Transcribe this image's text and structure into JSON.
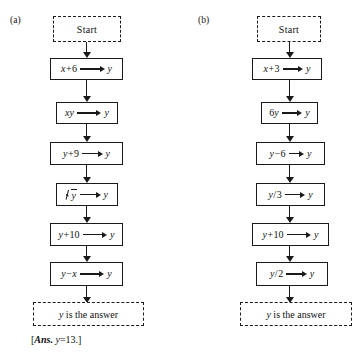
{
  "figure": {
    "panels": [
      {
        "label": "(a)",
        "start_label": "Start",
        "answer_label": "y is the answer",
        "answer_note": "[Ans. y = 13.]",
        "answer_note_parts": {
          "open": "[",
          "ans_word": "Ans.",
          "variable": "y",
          "equals": "=",
          "value": "13",
          "close": ".]"
        },
        "steps": [
          {
            "lhs": "x+6",
            "rhs": "y",
            "arrow": "long",
            "kind": "plain"
          },
          {
            "lhs": "xy",
            "rhs": "y",
            "arrow": "long",
            "kind": "plain"
          },
          {
            "lhs": "y+9",
            "rhs": "y",
            "arrow": "mid",
            "kind": "plain"
          },
          {
            "lhs": "√y",
            "rhs": "y",
            "arrow": "mid",
            "kind": "radical"
          },
          {
            "lhs": "y+10",
            "rhs": "y",
            "arrow": "long",
            "kind": "plain"
          },
          {
            "lhs": "y−x",
            "rhs": "y",
            "arrow": "long",
            "kind": "plain"
          }
        ]
      },
      {
        "label": "(b)",
        "start_label": "Start",
        "answer_label": "y is the answer",
        "steps": [
          {
            "lhs": "x+3",
            "rhs": "y",
            "arrow": "mid",
            "kind": "plain"
          },
          {
            "lhs": "6y",
            "rhs": "y",
            "arrow": "mid",
            "kind": "plain"
          },
          {
            "lhs": "y−6",
            "rhs": "y",
            "arrow": "short",
            "kind": "plain"
          },
          {
            "lhs": "y/3",
            "rhs": "y",
            "arrow": "mid",
            "kind": "plain"
          },
          {
            "lhs": "y+10",
            "rhs": "y",
            "arrow": "long",
            "kind": "plain"
          },
          {
            "lhs": "y/2",
            "rhs": "y",
            "arrow": "mid",
            "kind": "plain"
          }
        ]
      }
    ]
  },
  "colors": {
    "ink": "#1a1a1a",
    "background": "#ffffff"
  }
}
